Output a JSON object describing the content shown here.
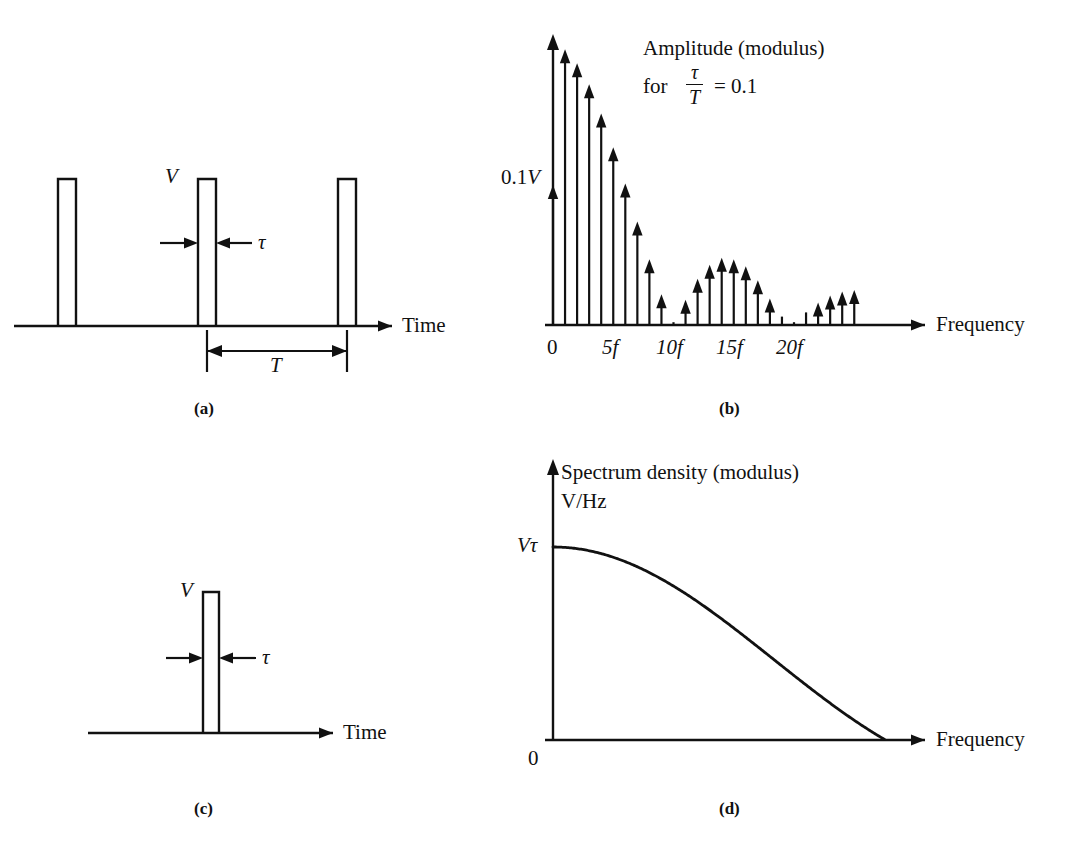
{
  "figure": {
    "panels": [
      {
        "id": "a",
        "caption": "(a)",
        "kind": "pulse-train-time",
        "axis_label": "Time",
        "amplitude_label": "V",
        "width_label": "τ",
        "period_label": "T",
        "pulse_count": 3
      },
      {
        "id": "b",
        "caption": "(b)",
        "kind": "line-spectrum",
        "title_line1": "Amplitude (modulus)",
        "title_line2_prefix": "for",
        "fraction_numerator": "τ",
        "fraction_denominator": "T",
        "title_line2_suffix": "= 0.1",
        "y_label": "0.1V",
        "y_label_number": "0.1",
        "y_label_symbol": "V",
        "x_axis_label": "Frequency",
        "x_ticks": [
          "0",
          "5f",
          "10f",
          "15f",
          "20f"
        ]
      },
      {
        "id": "c",
        "caption": "(c)",
        "kind": "single-pulse-time",
        "axis_label": "Time",
        "amplitude_label": "V",
        "width_label": "τ",
        "pulse_count": 1
      },
      {
        "id": "d",
        "caption": "(d)",
        "kind": "spectrum-density",
        "title_line1": "Spectrum density (modulus)",
        "title_line2": "V/Hz",
        "y_label": "Vτ",
        "origin_label": "0",
        "x_axis_label": "Frequency"
      }
    ]
  },
  "chart_data": [
    {
      "type": "line",
      "panel": "a",
      "title": "Periodic rectangular pulse train",
      "xlabel": "Time",
      "ylabel": "V",
      "annotations": [
        "V",
        "τ",
        "T"
      ],
      "pulse_amplitude": 1.0,
      "pulse_width_ratio": 0.1,
      "period": 1.0,
      "pulse_centers": [
        0.0,
        1.0,
        2.0
      ]
    },
    {
      "type": "bar",
      "panel": "b",
      "title": "Amplitude (modulus) for τ/T = 0.1",
      "xlabel": "Frequency",
      "ylabel": "0.1V",
      "categories": [
        "0",
        "1f",
        "2f",
        "3f",
        "4f",
        "5f",
        "6f",
        "7f",
        "8f",
        "9f",
        "10f",
        "11f",
        "12f",
        "13f",
        "14f",
        "15f",
        "16f",
        "17f",
        "18f",
        "19f",
        "20f",
        "21f",
        "22f",
        "23f",
        "24f",
        "25f"
      ],
      "values": [
        1.0,
        1.97,
        1.87,
        1.72,
        1.51,
        1.27,
        1.01,
        0.74,
        0.47,
        0.22,
        0.02,
        0.18,
        0.33,
        0.43,
        0.48,
        0.47,
        0.42,
        0.32,
        0.19,
        0.06,
        0.02,
        0.09,
        0.16,
        0.21,
        0.24,
        0.25
      ],
      "envelope": "|sinc(n*tau/T)| scaled, nulls at 10f and 20f",
      "xtick_labels": [
        "0",
        "5f",
        "10f",
        "15f",
        "20f"
      ],
      "xtick_indices": [
        0,
        5,
        10,
        15,
        20
      ],
      "ylim": [
        0,
        2.05
      ],
      "grid": false
    },
    {
      "type": "line",
      "panel": "c",
      "title": "Single rectangular pulse",
      "xlabel": "Time",
      "ylabel": "V",
      "annotations": [
        "V",
        "τ"
      ],
      "pulse_amplitude": 1.0,
      "pulse_width_ratio": 0.06
    },
    {
      "type": "line",
      "panel": "d",
      "title": "Spectrum density (modulus) V/Hz",
      "xlabel": "Frequency",
      "ylabel": "Vτ",
      "ylim": [
        0,
        1.0
      ],
      "peak_value": 1.0,
      "nulls_at_x": [
        0.465,
        0.93
      ],
      "sidelobe_peaks": [
        0.217,
        0.128
      ],
      "sidelobe_peak_x": [
        0.7,
        1.16
      ],
      "curve": "|sin(pi f tau)/(pi f tau)| rectified sinc envelope",
      "grid": false
    }
  ]
}
